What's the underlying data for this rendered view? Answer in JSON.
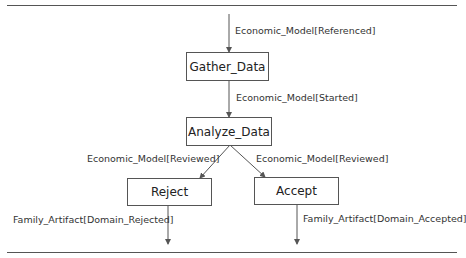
{
  "nodes": {
    "gather": "Gather_Data",
    "analyze": "Analyze_Data",
    "reject": "Reject",
    "accept": "Accept"
  },
  "edges": {
    "entry": "Economic_Model[Referenced]",
    "gather_to_analyze": "Economic_Model[Started]",
    "analyze_to_reject": "Economic_Model[Reviewed]",
    "analyze_to_accept": "Economic_Model[Reviewed]",
    "reject_out": "Family_Artifact[Domain_Rejected]",
    "accept_out": "Family_Artifact[Domain_Accepted]"
  },
  "colors": {
    "line": "#555555",
    "text": "#222222"
  }
}
